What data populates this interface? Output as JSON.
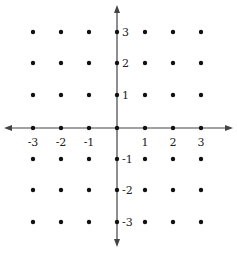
{
  "diagram": {
    "type": "coordinate-plane-lattice",
    "origin_px": [
      117,
      128
    ],
    "x_positions_px": [
      33,
      61,
      89,
      117,
      145,
      173,
      201
    ],
    "y_positions_px": [
      32,
      63,
      95,
      128,
      159,
      190,
      222
    ],
    "grid_values": [
      -3,
      -2,
      -1,
      0,
      1,
      2,
      3
    ],
    "x_axis": {
      "from_px": 4,
      "to_px": 233,
      "y_px": 128
    },
    "y_axis": {
      "from_px": 5,
      "to_px": 247,
      "x_px": 117
    },
    "x_tick_labels": [
      "-3",
      "-2",
      "-1",
      "1",
      "2",
      "3"
    ],
    "x_tick_values": [
      -3,
      -2,
      -1,
      1,
      2,
      3
    ],
    "y_tick_labels": [
      "3",
      "2",
      "1",
      "-1",
      "-2",
      "-3"
    ],
    "y_tick_values": [
      3,
      2,
      1,
      -1,
      -2,
      -3
    ],
    "colors": {
      "dot": "#111111",
      "axis": "#444444",
      "label": "#222222"
    }
  }
}
